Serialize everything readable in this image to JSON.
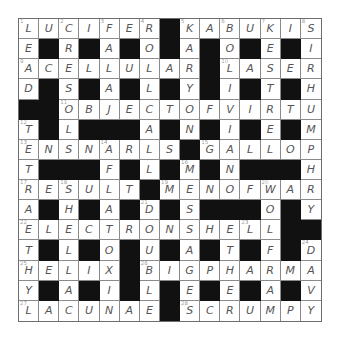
{
  "puzzle": {
    "size": 15,
    "rows": [
      "LUCIFER#KABUKIS",
      "E#R#A#O#A#O#E#I",
      "ACELLULAR#LASER",
      "D#S#A#L#Y#I#T#H",
      "##OBJECTOFVIRTU",
      "T#L###A#N#I#E#M",
      "ENSNARLS#GALLOP",
      "T###F#L#M#N###H",
      "RESULT#MENOFWAR",
      "A#H#A#D#S###O#Y",
      "ELECTRONSHELL##",
      "T#L#O#U#A#T#F#D",
      "HELIX#BIGPHARMA",
      "Y#A#I#L#E#E#A#V",
      "LACUNAE#SCRUMPY"
    ],
    "numbers": {
      "0,0": "1",
      "0,2": "2",
      "0,4": "3",
      "0,6": "4",
      "0,8": "5",
      "0,10": "6",
      "0,12": "7",
      "0,14": "8",
      "2,0": "9",
      "2,10": "10",
      "4,2": "11",
      "5,0": "12",
      "6,0": "13",
      "6,4": "14",
      "6,9": "15",
      "7,8": "16",
      "8,0": "17",
      "8,2": "18",
      "8,7": "19",
      "8,12": "20",
      "9,6": "21",
      "10,0": "22",
      "10,11": "23",
      "11,14": "24",
      "12,0": "25",
      "12,6": "26",
      "14,0": "27",
      "14,8": "28"
    }
  }
}
